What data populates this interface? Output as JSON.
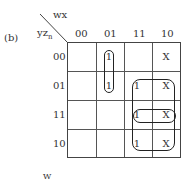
{
  "figure_label": "(b)",
  "top_var": "wx",
  "left_var": "yz",
  "left_var_sub": "n",
  "col_headers": [
    "00",
    "01",
    "11",
    "10"
  ],
  "row_headers": [
    "00",
    "01",
    "11",
    "10"
  ],
  "cells": [
    [
      "",
      "1",
      "",
      "X"
    ],
    [
      "",
      "1",
      "1",
      "X"
    ],
    [
      "",
      "",
      "1",
      "X"
    ],
    [
      "",
      "",
      "1",
      "X"
    ]
  ],
  "output_label": "W"
}
